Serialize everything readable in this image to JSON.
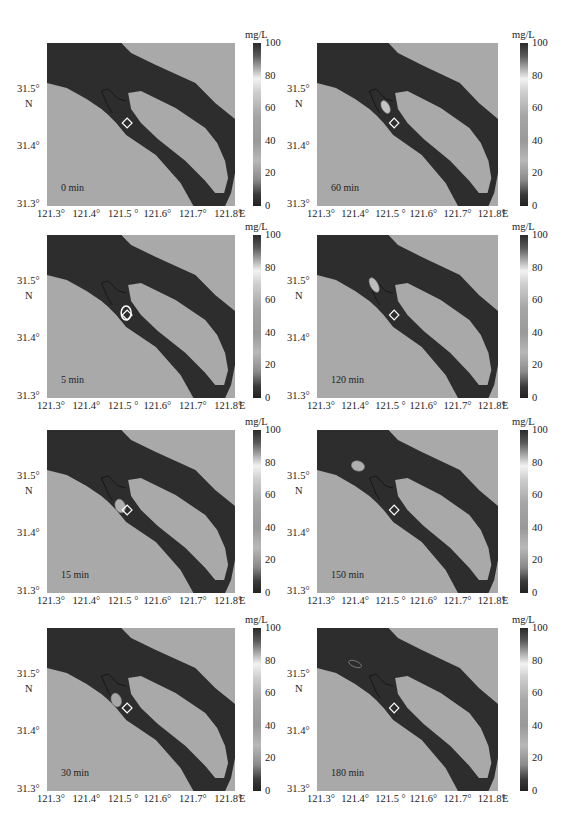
{
  "figure": {
    "colorbar": {
      "unit": "mg/L",
      "ticks": [
        "100",
        "80",
        "60",
        "40",
        "20",
        "0"
      ]
    },
    "axes": {
      "x_ticks": [
        "121.3°",
        "121.4°",
        "121.5 °",
        "121.6°",
        "121.7°",
        "121.8°"
      ],
      "x_unit": "E",
      "y_ticks": [
        "31.5°",
        "31.4°",
        "31.3°"
      ],
      "y_unit": "N"
    },
    "colors": {
      "land": "#a9a9a9",
      "water": "#2d2d2d",
      "marker": "#ffffff"
    }
  },
  "panels": [
    {
      "id": "p0",
      "time_label": "0 min"
    },
    {
      "id": "p60",
      "time_label": "60 min"
    },
    {
      "id": "p5",
      "time_label": "5 min"
    },
    {
      "id": "p120",
      "time_label": "120 min"
    },
    {
      "id": "p15",
      "time_label": "15 min"
    },
    {
      "id": "p150",
      "time_label": "150 min"
    },
    {
      "id": "p30",
      "time_label": "30 min"
    },
    {
      "id": "p180",
      "time_label": "180 min"
    }
  ],
  "chart_data": {
    "type": "heatmap",
    "title": "",
    "xlabel": "Longitude (°E)",
    "ylabel": "Latitude (°N)",
    "xlim": [
      121.3,
      121.8
    ],
    "ylim": [
      31.3,
      31.58
    ],
    "colorbar": {
      "label": "mg/L",
      "range": [
        0,
        100
      ],
      "ticks": [
        0,
        20,
        40,
        60,
        80,
        100
      ]
    },
    "release_site": {
      "lon": 121.52,
      "lat": 31.44
    },
    "series": [
      {
        "time_min": 0,
        "plume_center": null,
        "plume_peak_mg_L": 0
      },
      {
        "time_min": 5,
        "plume_center": {
          "lon": 121.52,
          "lat": 31.44
        },
        "plume_peak_mg_L": 80
      },
      {
        "time_min": 15,
        "plume_center": {
          "lon": 121.5,
          "lat": 31.45
        },
        "plume_peak_mg_L": 60
      },
      {
        "time_min": 30,
        "plume_center": {
          "lon": 121.48,
          "lat": 31.46
        },
        "plume_peak_mg_L": 50
      },
      {
        "time_min": 60,
        "plume_center": {
          "lon": 121.48,
          "lat": 31.47
        },
        "plume_peak_mg_L": 70
      },
      {
        "time_min": 120,
        "plume_center": {
          "lon": 121.45,
          "lat": 31.49
        },
        "plume_peak_mg_L": 60
      },
      {
        "time_min": 150,
        "plume_center": {
          "lon": 121.42,
          "lat": 31.52
        },
        "plume_peak_mg_L": 50
      },
      {
        "time_min": 180,
        "plume_center": {
          "lon": 121.4,
          "lat": 31.52
        },
        "plume_peak_mg_L": 30
      }
    ]
  }
}
